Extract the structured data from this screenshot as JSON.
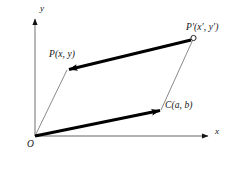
{
  "figure": {
    "background_color": "#ffffff",
    "axis_color": "#999999",
    "vector_color": "#000000",
    "construction_line_color": "#8a8a8a",
    "label_color": "#111111"
  },
  "axes": {
    "x_label": "x",
    "y_label": "y",
    "origin_label": "O",
    "x_axis": {
      "x1": 35,
      "y1": 136,
      "x2": 212,
      "y2": 136
    },
    "y_axis": {
      "x1": 35,
      "y1": 136,
      "x2": 35,
      "y2": 14
    }
  },
  "points": {
    "origin": {
      "label": "O",
      "x": 35,
      "y": 136,
      "marker": "none"
    },
    "p": {
      "label": "P(x, y)",
      "x": 67,
      "y": 70,
      "marker": "arrowhead"
    },
    "p_prime": {
      "label": "P'(x', y')",
      "x": 193,
      "y": 38,
      "marker": "open-circle"
    },
    "c": {
      "label": "C(a, b)",
      "x": 161,
      "y": 110,
      "marker": "arrowhead"
    }
  },
  "vectors": [
    {
      "name": "vector-OP-shifted",
      "from_label": "C(a, b)",
      "to_label": "P'(x', y')",
      "x1": 161,
      "y1": 110,
      "x2": 191,
      "y2": 40
    },
    {
      "name": "vector-P-to-Pprime",
      "from_label": "P(x, y)",
      "to_label": "P'(x', y')",
      "x1": 67,
      "y1": 70,
      "x2": 191,
      "y2": 40
    },
    {
      "name": "vector-O-to-C",
      "from_label": "O",
      "to_label": "C(a, b)",
      "x1": 35,
      "y1": 136,
      "x2": 161,
      "y2": 110
    }
  ],
  "construction_lines": [
    {
      "name": "line-O-to-P",
      "x1": 35,
      "y1": 136,
      "x2": 67,
      "y2": 70
    },
    {
      "name": "line-C-to-Pprime",
      "x1": 161,
      "y1": 110,
      "x2": 192,
      "y2": 41
    }
  ]
}
